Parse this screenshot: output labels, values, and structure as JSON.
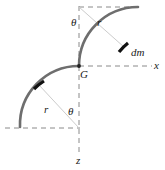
{
  "figure": {
    "labels": {
      "theta_top": "θ",
      "r_top": "r",
      "dm": "dm",
      "x_axis": "x",
      "centroid": "G",
      "r_bottom": "r",
      "theta_bottom": "θ",
      "z_axis": "z"
    },
    "colors": {
      "curve": "#6e6e6e",
      "curve_dark": "#111111",
      "dashed": "#8a8a8a",
      "radius_line": "#c2c2c2",
      "text": "#1a1a1a",
      "background": "#ffffff"
    },
    "geometry": {
      "origin": {
        "x": 79,
        "y": 66
      },
      "radius": 59,
      "upper_arc_center": {
        "x": 79,
        "y": 7
      },
      "lower_arc_center": {
        "x": 79,
        "y": 128
      },
      "upper_arc_from": {
        "x": 79,
        "y": 66
      },
      "upper_arc_to": {
        "x": 137,
        "y": 7
      },
      "lower_arc_from": {
        "x": 79,
        "y": 66
      },
      "lower_arc_to": {
        "x": 21,
        "y": 128
      },
      "dm_point": {
        "x": 124,
        "y": 47
      },
      "dm_point_lower": {
        "x": 39,
        "y": 85
      }
    },
    "axes": {
      "x_axis_dashed_from": {
        "x": 79,
        "y": 66
      },
      "x_axis_dashed_to": {
        "x": 152,
        "y": 66
      },
      "z_axis_dashed_from": {
        "x": 79,
        "y": 66
      },
      "z_axis_dashed_to": {
        "x": 79,
        "y": 152
      },
      "vertical_guide_top": {
        "x": 79,
        "y": 7
      },
      "top_guide_from": {
        "x": 79,
        "y": 7
      },
      "top_guide_to": {
        "x": 139,
        "y": 7
      },
      "bottom_guide_from": {
        "x": 5,
        "y": 128
      },
      "bottom_guide_to": {
        "x": 79,
        "y": 128
      }
    }
  }
}
